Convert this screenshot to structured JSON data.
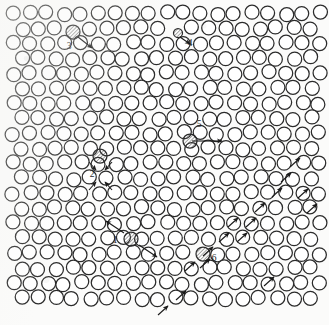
{
  "figure": {
    "name": "hexagonal-lattice-defect-diagram",
    "background_color": "#fbfbfa",
    "particle": {
      "stroke_color": "#2b2b2b",
      "fill_color": "#ffffff",
      "radius": 7.0,
      "stroke_width": 1.25
    },
    "hatch": {
      "color": "#3a3a3a",
      "angle_deg": 45,
      "spacing": 2.6
    },
    "arrow": {
      "color": "#1a1a1a",
      "stroke_width": 1.1,
      "head_length": 4.2
    },
    "lattice": {
      "type": "hexagonal-close-packed-2d",
      "columns": 19,
      "rows": 20,
      "spacing_x": 17.0,
      "spacing_y": 15.0,
      "row_offset_x": 8.5,
      "origin_x": 14.0,
      "origin_y": 14.0
    }
  },
  "labels": [
    {
      "id": "1",
      "text": "1",
      "x": 115,
      "y": 243
    },
    {
      "id": "2",
      "text": "2",
      "x": 92,
      "y": 177
    },
    {
      "id": "3",
      "text": "3",
      "x": 69,
      "y": 49
    },
    {
      "id": "4",
      "text": "4",
      "x": 190,
      "y": 46
    },
    {
      "id": "5",
      "text": "5",
      "x": 199,
      "y": 127
    },
    {
      "id": "6",
      "text": "6",
      "x": 214,
      "y": 261
    }
  ],
  "defects": [
    {
      "id": "1",
      "label": "1",
      "kind": "interstitial-dumbbell",
      "marked_particle": {
        "cx": 131,
        "cy": 239,
        "hatched": true
      },
      "arrows": [
        {
          "x1": 124,
          "y1": 233,
          "x2": 106,
          "y2": 221
        },
        {
          "x1": 139,
          "y1": 245,
          "x2": 157,
          "y2": 257
        }
      ]
    },
    {
      "id": "2",
      "label": "2",
      "kind": "vacancy-relaxation",
      "marked_particle": {
        "cx": 100,
        "cy": 156,
        "hatched": true
      },
      "arrows": [
        {
          "x1": 89,
          "y1": 162,
          "x2": 96,
          "y2": 170
        },
        {
          "x1": 112,
          "y1": 162,
          "x2": 105,
          "y2": 170
        },
        {
          "x1": 89,
          "y1": 190,
          "x2": 96,
          "y2": 182
        },
        {
          "x1": 112,
          "y1": 190,
          "x2": 105,
          "y2": 182
        }
      ]
    },
    {
      "id": "3",
      "label": "3",
      "kind": "single-displaced-particle",
      "marked_particle": {
        "cx": 73,
        "cy": 32,
        "hatched": true
      },
      "arrows": [
        {
          "x1": 78,
          "y1": 37,
          "x2": 92,
          "y2": 48
        }
      ]
    },
    {
      "id": "4",
      "label": "4",
      "kind": "small-interstitial",
      "marked_particle": {
        "cx": 178,
        "cy": 33,
        "hatched": true,
        "radius": 4.5
      },
      "arrows": [
        {
          "x1": 180,
          "y1": 37,
          "x2": 190,
          "y2": 44
        }
      ]
    },
    {
      "id": "5",
      "label": "5",
      "kind": "lateral-displacement",
      "marked_particle": {
        "cx": 190,
        "cy": 141,
        "hatched": true
      },
      "arrows": [
        {
          "x1": 192,
          "y1": 141,
          "x2": 222,
          "y2": 141
        }
      ]
    },
    {
      "id": "6",
      "label": "6",
      "kind": "dislocation-core",
      "marked_particle": {
        "cx": 203,
        "cy": 254,
        "hatched": true
      },
      "arrows": [
        {
          "x1": 200,
          "y1": 268,
          "x2": 210,
          "y2": 259
        }
      ]
    }
  ],
  "slip_line_arrows": {
    "description": "chain of in-particle displacement arrows along a lattice direction",
    "direction": "up-right",
    "items": [
      {
        "x1": 158,
        "y1": 315,
        "x2": 168,
        "y2": 306
      },
      {
        "x1": 176,
        "y1": 300,
        "x2": 186,
        "y2": 291
      },
      {
        "x1": 185,
        "y1": 271,
        "x2": 195,
        "y2": 262
      },
      {
        "x1": 203,
        "y1": 256,
        "x2": 213,
        "y2": 247
      },
      {
        "x1": 237,
        "y1": 242,
        "x2": 247,
        "y2": 233
      },
      {
        "x1": 246,
        "y1": 227,
        "x2": 256,
        "y2": 218
      },
      {
        "x1": 255,
        "y1": 212,
        "x2": 265,
        "y2": 203
      },
      {
        "x1": 272,
        "y1": 197,
        "x2": 282,
        "y2": 188
      },
      {
        "x1": 281,
        "y1": 182,
        "x2": 291,
        "y2": 173
      },
      {
        "x1": 290,
        "y1": 167,
        "x2": 300,
        "y2": 158
      },
      {
        "x1": 298,
        "y1": 198,
        "x2": 308,
        "y2": 189
      },
      {
        "x1": 307,
        "y1": 213,
        "x2": 317,
        "y2": 204
      },
      {
        "x1": 264,
        "y1": 286,
        "x2": 274,
        "y2": 277
      },
      {
        "x1": 228,
        "y1": 227,
        "x2": 238,
        "y2": 218
      },
      {
        "x1": 219,
        "y1": 242,
        "x2": 229,
        "y2": 233
      }
    ]
  }
}
